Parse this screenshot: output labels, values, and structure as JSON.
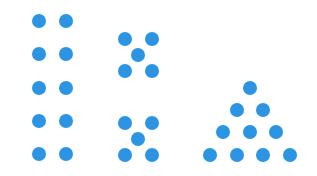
{
  "diagram": {
    "dot_color": "#2B95E3",
    "dot_diameter": 14,
    "groups": [
      {
        "name": "two-columns-of-five",
        "count": 10,
        "dots": [
          [
            39,
            21
          ],
          [
            66,
            21
          ],
          [
            39,
            54
          ],
          [
            66,
            54
          ],
          [
            39,
            88
          ],
          [
            66,
            88
          ],
          [
            39,
            121
          ],
          [
            66,
            121
          ],
          [
            39,
            154
          ],
          [
            66,
            154
          ]
        ]
      },
      {
        "name": "two-dice-fives",
        "count": 10,
        "dots": [
          [
            125,
            39
          ],
          [
            152,
            39
          ],
          [
            138,
            55
          ],
          [
            125,
            71
          ],
          [
            152,
            71
          ],
          [
            125,
            123
          ],
          [
            152,
            123
          ],
          [
            138,
            139
          ],
          [
            125,
            155
          ],
          [
            152,
            155
          ]
        ]
      },
      {
        "name": "triangle-of-ten",
        "count": 10,
        "dots": [
          [
            250,
            88
          ],
          [
            237,
            110
          ],
          [
            263,
            110
          ],
          [
            223,
            132
          ],
          [
            250,
            132
          ],
          [
            276,
            132
          ],
          [
            210,
            155
          ],
          [
            237,
            155
          ],
          [
            263,
            155
          ],
          [
            290,
            155
          ]
        ]
      }
    ]
  }
}
